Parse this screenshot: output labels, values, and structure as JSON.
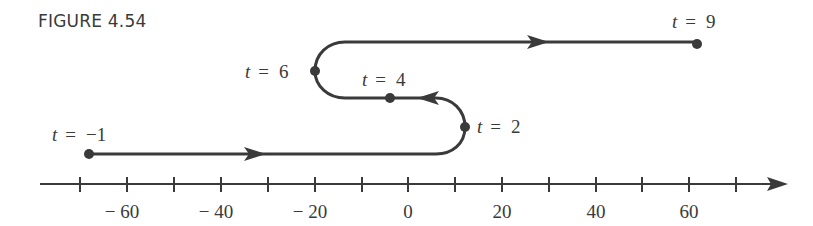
{
  "caption": "FIGURE 4.54",
  "colors": {
    "ink": "#3a3a3a",
    "background": "#ffffff"
  },
  "axis": {
    "ticks": [
      -70,
      -60,
      -50,
      -40,
      -30,
      -20,
      -10,
      0,
      10,
      20,
      30,
      40,
      50,
      60,
      70
    ],
    "labels": [
      {
        "value": -60,
        "text": "− 60"
      },
      {
        "value": -40,
        "text": "− 40"
      },
      {
        "value": -20,
        "text": "− 20"
      },
      {
        "value": 0,
        "text": "0"
      },
      {
        "value": 20,
        "text": "20"
      },
      {
        "value": 40,
        "text": "40"
      },
      {
        "value": 60,
        "text": "60"
      }
    ]
  },
  "points": [
    {
      "t": -1,
      "var": "t",
      "eq": "=",
      "val": "−1",
      "position": -68
    },
    {
      "t": 2,
      "var": "t",
      "eq": "=",
      "val": "2",
      "position": 12
    },
    {
      "t": 4,
      "var": "t",
      "eq": "=",
      "val": "4",
      "position": -4
    },
    {
      "t": 6,
      "var": "t",
      "eq": "=",
      "val": "6",
      "position": -20
    },
    {
      "t": 9,
      "var": "t",
      "eq": "=",
      "val": "9",
      "position": 62
    }
  ],
  "path_direction_arrows": [
    {
      "segment": "t=-1 to t=2",
      "direction": "right"
    },
    {
      "segment": "t=2 to t=6",
      "direction": "left"
    },
    {
      "segment": "t=6 to t=9",
      "direction": "right"
    }
  ]
}
